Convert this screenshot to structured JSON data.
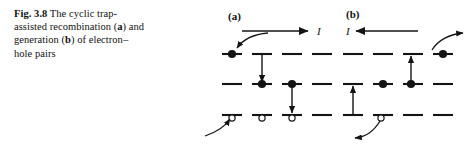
{
  "figure": {
    "number": "Fig. 3.8",
    "caption_line1_prefix": "Fig. 3.8",
    "caption_text_1": "  The cyclic trap-",
    "caption_text_2": "assisted recombination",
    "caption_text_3a": "(",
    "caption_text_3b": "a",
    "caption_text_3c": ") and generation (",
    "caption_text_3d": "b",
    "caption_text_3e": ") of",
    "caption_text_4": "electron–hole pairs",
    "caption_full": "Fig. 3.8  The cyclic trap-assisted recombination (a) and generation (b) of electron–hole pairs"
  },
  "panels": [
    {
      "id": "a",
      "tag": "(a)",
      "current_label": "I",
      "current_direction": "right",
      "description": "cyclic trap-assisted recombination",
      "bands": [
        {
          "name": "conduction-band",
          "y": 54
        },
        {
          "name": "trap-level",
          "y": 84
        },
        {
          "name": "valence-band",
          "y": 115
        }
      ],
      "electrons": [
        {
          "band": "conduction-band",
          "x": 32
        },
        {
          "band": "trap-level",
          "x": 62
        },
        {
          "band": "trap-level",
          "x": 92
        }
      ],
      "holes": [
        {
          "band": "valence-band",
          "x": 32
        },
        {
          "band": "valence-band",
          "x": 62
        },
        {
          "band": "valence-band",
          "x": 92
        }
      ],
      "transitions": [
        {
          "name": "capture-electron",
          "x": 62,
          "from": 54,
          "to": 84,
          "direction": "down"
        },
        {
          "name": "capture-hole",
          "x": 92,
          "from": 84,
          "to": 115,
          "direction": "down"
        }
      ],
      "curved_arrows": [
        {
          "name": "electron-in-arrow",
          "target": "conduction-band-electron"
        },
        {
          "name": "hole-in-arrow",
          "target": "valence-band-hole"
        }
      ]
    },
    {
      "id": "b",
      "tag": "(b)",
      "current_label": "I",
      "current_direction": "left",
      "description": "cyclic trap-assisted generation",
      "bands": [
        {
          "name": "conduction-band",
          "y": 54
        },
        {
          "name": "trap-level",
          "y": 84
        },
        {
          "name": "valence-band",
          "y": 115
        }
      ],
      "electrons": [
        {
          "band": "conduction-band",
          "x": 95
        },
        {
          "band": "trap-level",
          "x": 35
        },
        {
          "band": "trap-level",
          "x": 63
        }
      ],
      "holes": [
        {
          "band": "valence-band",
          "x": 35
        }
      ],
      "transitions": [
        {
          "name": "emit-electron",
          "x": 63,
          "from": 84,
          "to": 54,
          "direction": "up"
        },
        {
          "name": "emit-hole",
          "x": 5,
          "from": 115,
          "to": 84,
          "direction": "up"
        }
      ],
      "curved_arrows": [
        {
          "name": "electron-out-arrow",
          "target": "conduction-band-electron"
        },
        {
          "name": "hole-out-arrow",
          "target": "valence-band-hole"
        }
      ]
    }
  ],
  "colors": {
    "ink": "#111111",
    "background": "#ffffff",
    "line": "#1a1a1a"
  }
}
